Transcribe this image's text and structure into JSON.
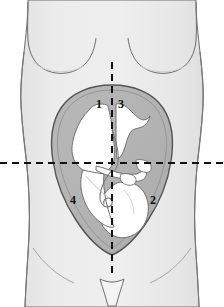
{
  "figure": {
    "canvas": {
      "width": 224,
      "height": 307,
      "background": "#ffffff"
    }
  },
  "colors": {
    "background": "#ffffff",
    "body_fill": "#e9e9e9",
    "body_fill_shadow": "#e0e0e0",
    "body_outline": "#6b6b6b",
    "uterus_fill": "#b3b3b3",
    "uterus_outline": "#585858",
    "fetus_fill": "#ffffff",
    "fetus_outline": "#707070",
    "crosshair": "#111111",
    "label_text": "#101010"
  },
  "crosshair": {
    "name": "quadrant-divider-lines",
    "vertical": {
      "x": 112,
      "y_start": 62,
      "y_end": 274,
      "dash": "7,5",
      "width": 2
    },
    "horizontal": {
      "y": 163,
      "x_start": 0,
      "x_end": 224,
      "dash": "7,5",
      "width": 2
    }
  },
  "labels": [
    {
      "id": "1",
      "text": "1",
      "quadrant": "right-upper-quadrant",
      "x": 99,
      "y": 104
    },
    {
      "id": "3",
      "text": "3",
      "quadrant": "left-upper-quadrant",
      "x": 121,
      "y": 104
    },
    {
      "id": "4",
      "text": "4",
      "quadrant": "right-lower-quadrant",
      "x": 73,
      "y": 200
    },
    {
      "id": "2",
      "text": "2",
      "quadrant": "left-lower-quadrant",
      "x": 153,
      "y": 200
    }
  ],
  "anatomy": {
    "torso": "female torso silhouette, anterior view",
    "breast_left": "left breast contour",
    "breast_right": "right breast contour",
    "pubic_triangle": "pubic region triangle",
    "uterus": "gravid uterus, oval",
    "fetus": "fetus in cephalic (vertex) presentation",
    "umbilical_cord": "umbilical cord"
  }
}
